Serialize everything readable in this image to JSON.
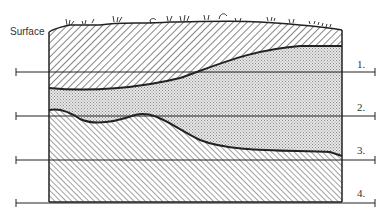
{
  "diagram": {
    "surface_label": "Surface",
    "levels": [
      {
        "label": "1.",
        "y": 72
      },
      {
        "label": "2.",
        "y": 116
      },
      {
        "label": "3.",
        "y": 160
      },
      {
        "label": "4.",
        "y": 202
      }
    ]
  },
  "colors": {
    "ink": "#222222",
    "stipple": "#cfcfcf",
    "background": "#ffffff"
  }
}
